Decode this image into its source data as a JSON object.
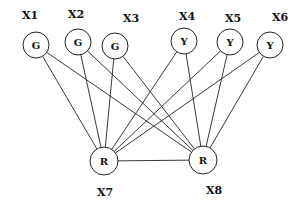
{
  "diagram": {
    "type": "bipartite-graph",
    "nodes": [
      {
        "id": "X1",
        "label": "X1",
        "value": "G",
        "cx": 36,
        "cy": 45,
        "r": 13,
        "lx": 22,
        "ly": 19
      },
      {
        "id": "X2",
        "label": "X2",
        "value": "G",
        "cx": 78,
        "cy": 42,
        "r": 13,
        "lx": 68,
        "ly": 18
      },
      {
        "id": "X3",
        "label": "X3",
        "value": "G",
        "cx": 115,
        "cy": 46,
        "r": 13,
        "lx": 123,
        "ly": 22
      },
      {
        "id": "X4",
        "label": "X4",
        "value": "Y",
        "cx": 184,
        "cy": 41,
        "r": 13,
        "lx": 179,
        "ly": 20
      },
      {
        "id": "X5",
        "label": "X5",
        "value": "Y",
        "cx": 230,
        "cy": 42,
        "r": 13,
        "lx": 225,
        "ly": 22
      },
      {
        "id": "X6",
        "label": "X6",
        "value": "Y",
        "cx": 270,
        "cy": 45,
        "r": 13,
        "lx": 272,
        "ly": 21
      },
      {
        "id": "X7",
        "label": "X7",
        "value": "R",
        "cx": 104,
        "cy": 161,
        "r": 14,
        "lx": 97,
        "ly": 196
      },
      {
        "id": "X8",
        "label": "X8",
        "value": "R",
        "cx": 203,
        "cy": 160,
        "r": 14,
        "lx": 206,
        "ly": 194
      }
    ],
    "edges": [
      [
        "X1",
        "X7"
      ],
      [
        "X1",
        "X8"
      ],
      [
        "X2",
        "X7"
      ],
      [
        "X2",
        "X8"
      ],
      [
        "X3",
        "X7"
      ],
      [
        "X3",
        "X8"
      ],
      [
        "X4",
        "X7"
      ],
      [
        "X4",
        "X8"
      ],
      [
        "X5",
        "X7"
      ],
      [
        "X5",
        "X8"
      ],
      [
        "X6",
        "X7"
      ],
      [
        "X6",
        "X8"
      ],
      [
        "X7",
        "X8"
      ]
    ]
  }
}
